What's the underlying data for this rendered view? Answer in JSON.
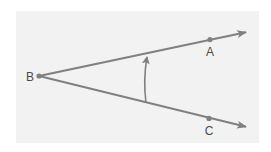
{
  "diagram": {
    "type": "angle",
    "colors": {
      "background": "#f2f2f2",
      "stroke": "#808080",
      "text": "#4a4a4a"
    },
    "vertex": {
      "label": "B",
      "x": 39,
      "y": 76
    },
    "points": [
      {
        "label": "A",
        "x": 210,
        "y": 39,
        "label_x": 210,
        "label_y": 56
      },
      {
        "label": "C",
        "x": 209,
        "y": 118,
        "label_x": 209,
        "label_y": 135
      }
    ],
    "rays": [
      {
        "name": "ray-BA",
        "from": [
          39,
          76
        ],
        "to": [
          247,
          32
        ]
      },
      {
        "name": "ray-BC",
        "from": [
          39,
          76
        ],
        "to": [
          247,
          127
        ]
      }
    ],
    "arc": {
      "from": [
        146,
        104
      ],
      "to": [
        147,
        56
      ],
      "direction": "counterclockwise"
    }
  }
}
